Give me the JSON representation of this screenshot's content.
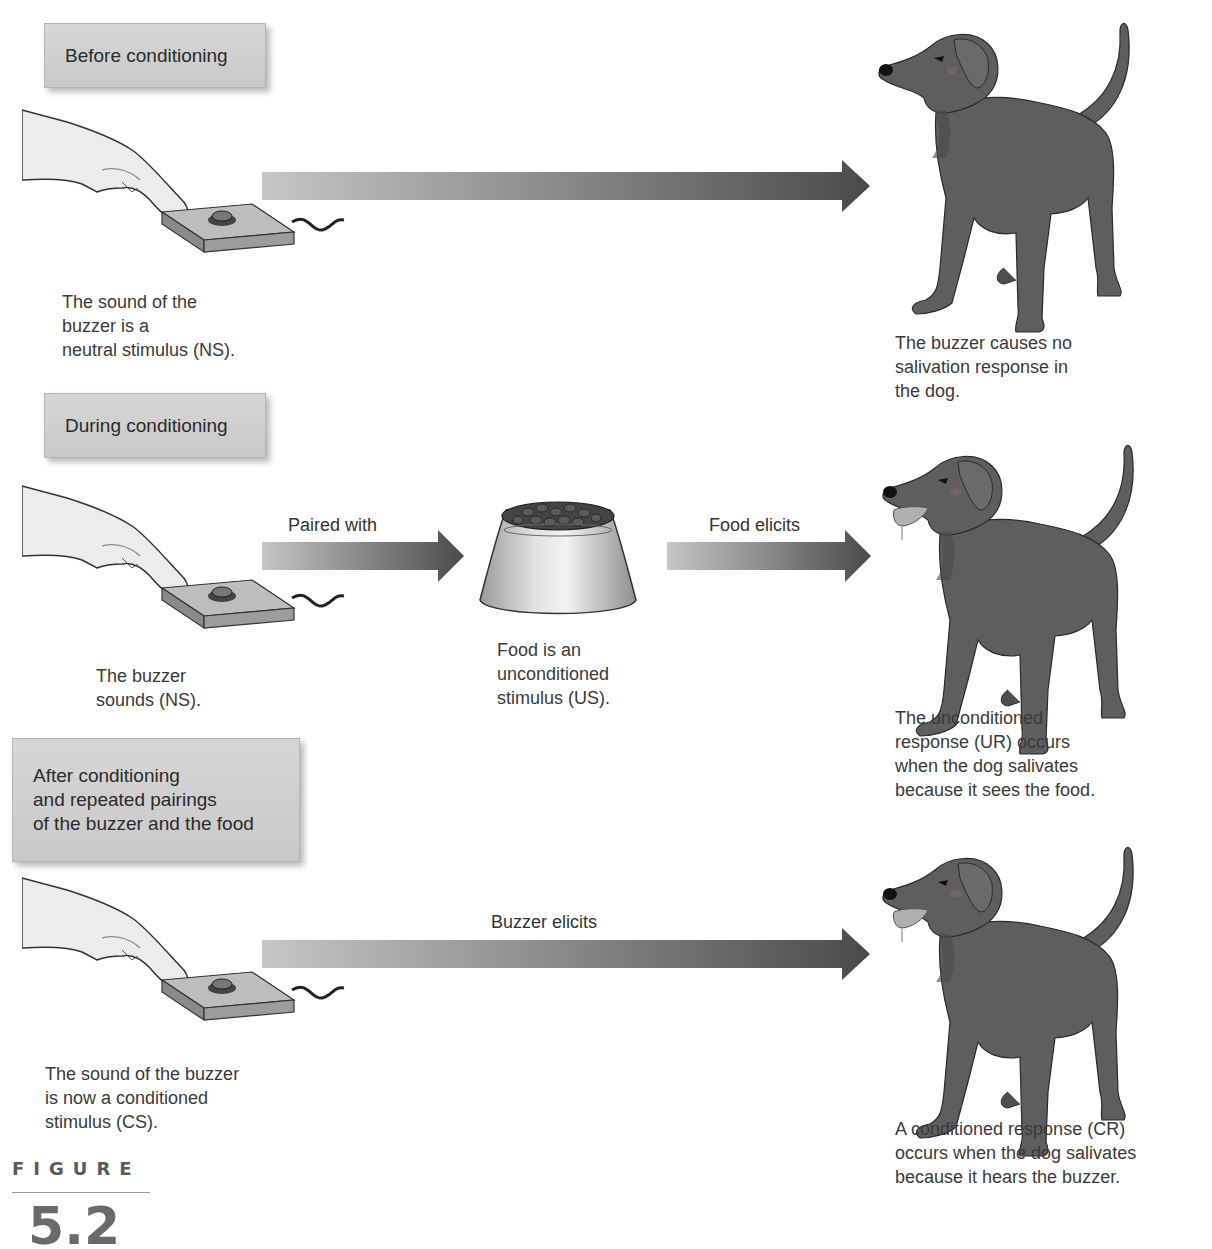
{
  "figure": {
    "word": "FIGURE",
    "number": "5.2"
  },
  "stages": [
    {
      "label": "Before conditioning",
      "stimulus_caption": "The sound of the\nbuzzer is a\nneutral stimulus (NS).",
      "arrows": [
        {
          "label": ""
        }
      ],
      "response_caption": "The buzzer causes no\nsalivation response in\nthe dog."
    },
    {
      "label": "During conditioning",
      "stimulus_caption": "The buzzer\nsounds (NS).",
      "arrows": [
        {
          "label": "Paired with"
        },
        {
          "label": "Food elicits"
        }
      ],
      "middle_caption": "Food is an\nunconditioned\nstimulus (US).",
      "response_caption": "The unconditioned\nresponse (UR) occurs\nwhen the dog salivates\nbecause it sees the food."
    },
    {
      "label": "After conditioning\nand repeated pairings\nof the buzzer and the food",
      "label_lines": [
        "After conditioning",
        "and repeated pairings",
        "of the buzzer and the food"
      ],
      "stimulus_caption": "The sound of the buzzer\nis now a conditioned\nstimulus (CS).",
      "arrows": [
        {
          "label": "Buzzer elicits"
        }
      ],
      "response_caption": "A conditioned response (CR)\noccurs when the dog salivates\nbecause it hears the buzzer."
    }
  ],
  "colors": {
    "arrow_start": "#c4c4c4",
    "arrow_end": "#4a4a4a",
    "dog": "#5e5e5e",
    "label_box": "#cfcfcf"
  }
}
